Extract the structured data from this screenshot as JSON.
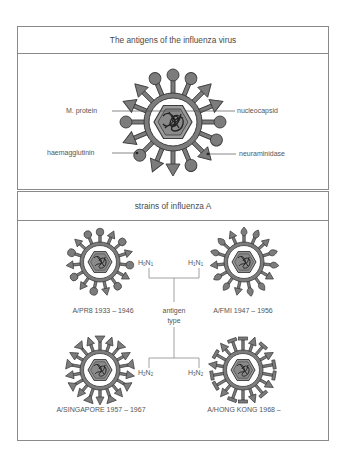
{
  "panel1": {
    "title": "The antigens of the influenza virus",
    "labels": {
      "m_protein": "M. protein",
      "haemagglutinin": "haemagglutinin",
      "nucleocapsid": "nucleocapsid",
      "neuraminidase": "neuraminidase"
    }
  },
  "panel2": {
    "title": "strains of influenza A",
    "center_label": {
      "line1": "antigen",
      "line2": "type"
    },
    "strains": [
      {
        "name": "A/PR8 1933 – 1946",
        "h": "H",
        "h_sub": "0",
        "n": "N",
        "n_sub": "1",
        "spike_style": "round"
      },
      {
        "name": "A/FMI 1947 – 1956",
        "h": "H",
        "h_sub": "1",
        "n": "N",
        "n_sub": "1",
        "spike_style": "leaf"
      },
      {
        "name": "A/SINGAPORE 1957 – 1967",
        "h": "H",
        "h_sub": "2",
        "n": "N",
        "n_sub": "2",
        "spike_style": "triangle"
      },
      {
        "name": "A/HONG KONG 1968 –",
        "h": "H",
        "h_sub": "3",
        "n": "N",
        "n_sub": "2",
        "spike_style": "tee"
      }
    ]
  },
  "colors": {
    "border": "#8a8a8a",
    "spike_fill": "#7c7c7c",
    "outline": "#3c3c3c",
    "hex_fill": "#9c9c9c",
    "text": "#4a4a4a"
  }
}
